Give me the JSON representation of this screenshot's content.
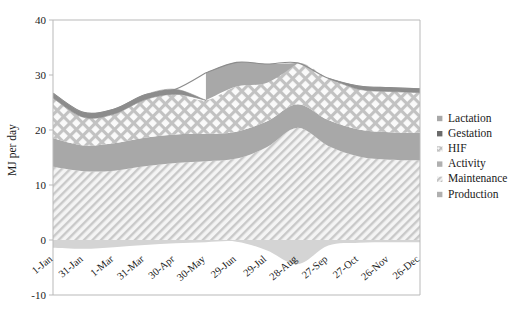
{
  "chart_data": {
    "type": "area",
    "title": "",
    "subtitle": "",
    "xlabel": "",
    "ylabel": "MJ per day",
    "ylim": [
      -10,
      40
    ],
    "yticks": [
      -10,
      0,
      10,
      20,
      30,
      40
    ],
    "ytick_labels": [
      "-10",
      "0",
      "10",
      "20",
      "30",
      "40"
    ],
    "grid": false,
    "legend_position": "right",
    "stacked": true,
    "categories": [
      "1-Jan",
      "31-Jan",
      "1-Mar",
      "31-Mar",
      "30-Apr",
      "30-May",
      "29-Jun",
      "29-Jul",
      "28-Aug",
      "27-Sep",
      "27-Oct",
      "26-Nov",
      "26-Dec"
    ],
    "x_index": [
      0,
      30,
      59,
      89,
      119,
      149,
      179,
      209,
      239,
      269,
      299,
      329,
      359
    ],
    "series": [
      {
        "name": "Production",
        "fill": "#a8a8a8",
        "pattern": "solid",
        "values": [
          0,
          0,
          0,
          0,
          0,
          0,
          0,
          0,
          0,
          0,
          0,
          0,
          0
        ]
      },
      {
        "name": "Maintenance",
        "fill": "#f0f0f0",
        "pattern": "diagonal-hatch",
        "values": [
          13.3,
          12.5,
          12.6,
          13.4,
          14.0,
          14.3,
          14.8,
          16.9,
          20.4,
          17.1,
          15.2,
          14.6,
          14.5
        ]
      },
      {
        "name": "Activity",
        "fill": "#a8a8a8",
        "pattern": "solid",
        "values": [
          5.2,
          4.7,
          5.0,
          5.2,
          5.2,
          5.0,
          4.9,
          4.7,
          4.3,
          4.7,
          4.9,
          5.0,
          5.0
        ]
      },
      {
        "name": "HIF",
        "fill": "#f5f5f5",
        "pattern": "crosshatch",
        "values": [
          7.3,
          5.1,
          5.3,
          6.9,
          7.3,
          6.1,
          8.2,
          7.0,
          7.5,
          7.6,
          7.3,
          7.4,
          7.3
        ]
      },
      {
        "name": "Gestation",
        "fill": "#8c8c8c",
        "pattern": "solid-dark",
        "values": [
          0.9,
          0.9,
          0.9,
          0.9,
          0.9,
          0.0,
          0.0,
          0.0,
          0.0,
          0.0,
          0.6,
          0.7,
          0.7
        ]
      },
      {
        "name": "Lactation",
        "fill": "#a8a8a8",
        "pattern": "solid",
        "values": [
          0.0,
          0.0,
          0.0,
          0.0,
          0.0,
          5.0,
          4.4,
          3.4,
          0.0,
          0.0,
          0.0,
          0.0,
          0.0
        ]
      }
    ],
    "bottom_band": {
      "name": "HIF-below-axis",
      "fill": "#d4d4d4",
      "values": [
        -1.4,
        -1.6,
        -1.3,
        -0.9,
        -0.6,
        -0.4,
        -0.3,
        -1.9,
        -4.4,
        -1.0,
        -0.5,
        -0.4,
        -0.4
      ]
    }
  },
  "legend": {
    "items": [
      {
        "label": "Lactation",
        "swatch": "#a8a8a8",
        "marker": "square-solid"
      },
      {
        "label": "Gestation",
        "swatch": "#6b6b6b",
        "marker": "square-dark"
      },
      {
        "label": "HIF",
        "swatch": "#f2f2f2",
        "marker": "square-crosshatch"
      },
      {
        "label": "Activity",
        "swatch": "#b0b0b0",
        "marker": "square-solid"
      },
      {
        "label": "Maintenance",
        "swatch": "#eeeeee",
        "marker": "square-hatch"
      },
      {
        "label": "Production",
        "swatch": "#b0b0b0",
        "marker": "square-solid"
      }
    ]
  },
  "axes": {
    "y_title": "MJ per day",
    "y_ticks": [
      "40",
      "30",
      "20",
      "10",
      "0",
      "-10"
    ],
    "x_ticks": [
      "1-Jan",
      "31-Jan",
      "1-Mar",
      "31-Mar",
      "30-Apr",
      "30-May",
      "29-Jun",
      "29-Jul",
      "28-Aug",
      "27-Sep",
      "27-Oct",
      "26-Nov",
      "26-Dec"
    ]
  },
  "colors": {
    "solid_gray": "#a8a8a8",
    "dark_gray": "#8c8c8c",
    "light_gray": "#d4d4d4",
    "hatch_bg": "#f2f2f2",
    "axis": "#b9b9b9",
    "text": "#1a1a1a"
  }
}
